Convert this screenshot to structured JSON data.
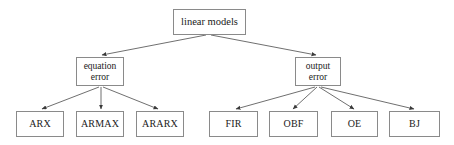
{
  "diagram": {
    "title_text": "linear models",
    "style": {
      "background": "#ffffff",
      "box_border": "#8a8a8a",
      "edge_color": "#4a4a4a",
      "text_color": "#1a1a1a"
    },
    "root": {
      "id": "linear-models",
      "label": "linear models",
      "x": 173,
      "y": 9,
      "w": 73,
      "h": 26
    },
    "mid_nodes": [
      {
        "id": "equation-error",
        "label_line1": "equation",
        "label_line2": "error",
        "x": 76,
        "y": 57,
        "w": 48,
        "h": 29
      },
      {
        "id": "output-error",
        "label_line1": "output",
        "label_line2": "error",
        "x": 295,
        "y": 57,
        "w": 46,
        "h": 29
      }
    ],
    "leaf_nodes": [
      {
        "id": "arx",
        "label": "ARX",
        "x": 16,
        "y": 111,
        "w": 48,
        "h": 26,
        "parent": "equation-error"
      },
      {
        "id": "armax",
        "label": "ARMAX",
        "x": 76,
        "y": 111,
        "w": 48,
        "h": 26,
        "parent": "equation-error"
      },
      {
        "id": "ararx",
        "label": "ARARX",
        "x": 136,
        "y": 111,
        "w": 48,
        "h": 26,
        "parent": "equation-error"
      },
      {
        "id": "fir",
        "label": "FIR",
        "x": 209,
        "y": 111,
        "w": 49,
        "h": 26,
        "parent": "output-error"
      },
      {
        "id": "obf",
        "label": "OBF",
        "x": 269,
        "y": 111,
        "w": 49,
        "h": 26,
        "parent": "output-error"
      },
      {
        "id": "oe",
        "label": "OE",
        "x": 331,
        "y": 111,
        "w": 47,
        "h": 26,
        "parent": "output-error"
      },
      {
        "id": "bj",
        "label": "BJ",
        "x": 389,
        "y": 111,
        "w": 51,
        "h": 26,
        "parent": "output-error"
      }
    ],
    "edges": [
      {
        "id": "edge-root-equation",
        "from": "linear-models",
        "to": "equation-error",
        "x1": 206,
        "y1": 35,
        "x2": 102,
        "y2": 55
      },
      {
        "id": "edge-root-output",
        "from": "linear-models",
        "to": "output-error",
        "x1": 211,
        "y1": 35,
        "x2": 316,
        "y2": 55
      },
      {
        "id": "edge-equation-arx",
        "from": "equation-error",
        "to": "arx",
        "x1": 99,
        "y1": 87,
        "x2": 42,
        "y2": 109
      },
      {
        "id": "edge-equation-armax",
        "from": "equation-error",
        "to": "armax",
        "x1": 101,
        "y1": 87,
        "x2": 101,
        "y2": 109
      },
      {
        "id": "edge-equation-ararx",
        "from": "equation-error",
        "to": "ararx",
        "x1": 103,
        "y1": 87,
        "x2": 158,
        "y2": 109
      },
      {
        "id": "edge-output-fir",
        "from": "output-error",
        "to": "fir",
        "x1": 315,
        "y1": 87,
        "x2": 236,
        "y2": 109
      },
      {
        "id": "edge-output-obf",
        "from": "output-error",
        "to": "obf",
        "x1": 317,
        "y1": 87,
        "x2": 293,
        "y2": 109
      },
      {
        "id": "edge-output-oe",
        "from": "output-error",
        "to": "oe",
        "x1": 319,
        "y1": 87,
        "x2": 354,
        "y2": 109
      },
      {
        "id": "edge-output-bj",
        "from": "output-error",
        "to": "bj",
        "x1": 321,
        "y1": 87,
        "x2": 414,
        "y2": 109
      }
    ]
  }
}
